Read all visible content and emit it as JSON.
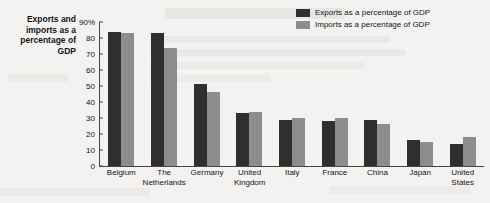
{
  "chart_data": {
    "type": "bar",
    "title": "",
    "xlabel": "",
    "ylabel": "Exports and imports as a percentage of GDP",
    "ylim": [
      0,
      90
    ],
    "ytick_labels": [
      "90%",
      "80",
      "70",
      "60",
      "50",
      "40",
      "30",
      "20",
      "10",
      "0"
    ],
    "yticks": [
      90,
      80,
      70,
      60,
      50,
      40,
      30,
      20,
      10,
      0
    ],
    "grid": false,
    "legend_position": "top-right",
    "categories": [
      "Belgium",
      "The Netherlands",
      "Germany",
      "United Kingdom",
      "Italy",
      "France",
      "China",
      "Japan",
      "United States"
    ],
    "series": [
      {
        "name": "Exports as a percentage of GDP",
        "color": "#2f2f2f",
        "values": [
          84,
          83,
          51,
          33,
          29,
          28,
          29,
          16,
          14
        ]
      },
      {
        "name": "Imports as a percentage of GDP",
        "color": "#8d8d8d",
        "values": [
          83,
          74,
          46,
          34,
          30,
          30,
          26,
          15,
          18
        ]
      }
    ]
  },
  "legend": {
    "items": [
      {
        "label": "Exports as a percentage of GDP",
        "color": "#2f2f2f"
      },
      {
        "label": "Imports as a percentage of GDP",
        "color": "#8d8d8d"
      }
    ]
  },
  "axis_caption": {
    "line1": "Exports and",
    "line2": "imports as a",
    "line3": "percentage of",
    "line4": "GDP"
  }
}
